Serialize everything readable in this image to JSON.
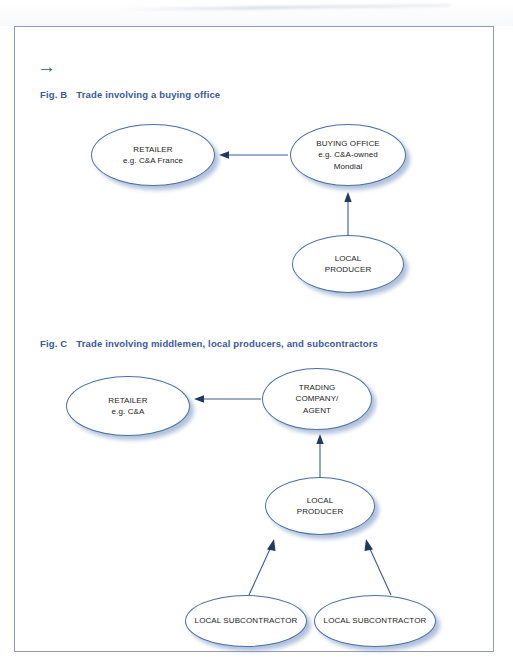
{
  "page": {
    "nav_arrow_icon": "→",
    "frame_color": "#8e9bb3",
    "heading_color": "#39599a",
    "node_border_color": "#4a6fa5",
    "node_shadow_color": "#7f9bc4",
    "connector_color": "#3a5a96"
  },
  "figures": [
    {
      "id": "fig-b",
      "label": "Fig. B",
      "title": "Trade involving a buying office",
      "nodes": [
        {
          "name": "retailer",
          "lines": [
            "RETAILER",
            "e.g. C&A France"
          ]
        },
        {
          "name": "buying-office",
          "lines": [
            "BUYING OFFICE",
            "e.g. C&A-owned",
            "Mondial"
          ]
        },
        {
          "name": "local-producer",
          "lines": [
            "LOCAL",
            "PRODUCER"
          ]
        }
      ],
      "connectors": [
        {
          "from": "buying-office",
          "to": "retailer",
          "direction": "left"
        },
        {
          "from": "local-producer",
          "to": "buying-office",
          "direction": "up"
        }
      ]
    },
    {
      "id": "fig-c",
      "label": "Fig. C",
      "title": "Trade involving middlemen, local producers, and subcontractors",
      "nodes": [
        {
          "name": "retailer",
          "lines": [
            "RETAILER",
            "e.g. C&A"
          ]
        },
        {
          "name": "trading-company-agent",
          "lines": [
            "TRADING",
            "COMPANY/",
            "AGENT"
          ]
        },
        {
          "name": "local-producer",
          "lines": [
            "LOCAL",
            "PRODUCER"
          ]
        },
        {
          "name": "local-subcontractor-left",
          "lines": [
            "LOCAL SUBCONTRACTOR"
          ]
        },
        {
          "name": "local-subcontractor-right",
          "lines": [
            "LOCAL SUBCONTRACTOR"
          ]
        }
      ],
      "connectors": [
        {
          "from": "trading-company-agent",
          "to": "retailer",
          "direction": "left"
        },
        {
          "from": "local-producer",
          "to": "trading-company-agent",
          "direction": "up"
        },
        {
          "from": "local-subcontractor-left",
          "to": "local-producer",
          "direction": "up-right"
        },
        {
          "from": "local-subcontractor-right",
          "to": "local-producer",
          "direction": "up-left"
        }
      ]
    }
  ],
  "text": {
    "fig_b_label": "Fig. B",
    "fig_b_title": "Trade involving a buying office",
    "fig_c_label": "Fig. C",
    "fig_c_title": "Trade involving middlemen, local producers, and subcontractors",
    "b_retailer_l1": "RETAILER",
    "b_retailer_l2": "e.g. C&A France",
    "b_buying_l1": "BUYING OFFICE",
    "b_buying_l2": "e.g. C&A-owned",
    "b_buying_l3": "Mondial",
    "b_producer_l1": "LOCAL",
    "b_producer_l2": "PRODUCER",
    "c_retailer_l1": "RETAILER",
    "c_retailer_l2": "e.g. C&A",
    "c_trading_l1": "TRADING",
    "c_trading_l2": "COMPANY/",
    "c_trading_l3": "AGENT",
    "c_producer_l1": "LOCAL",
    "c_producer_l2": "PRODUCER",
    "c_sub_left": "LOCAL SUBCONTRACTOR",
    "c_sub_right": "LOCAL SUBCONTRACTOR",
    "nav_arrow": "→"
  }
}
